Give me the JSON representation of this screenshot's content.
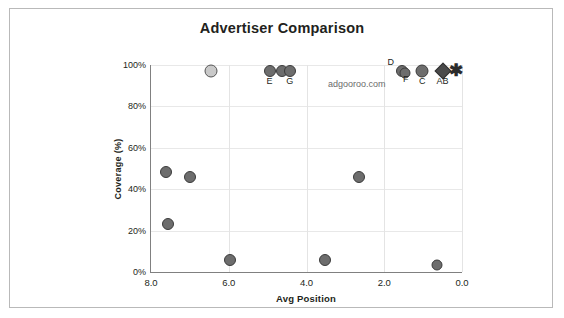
{
  "chart_data": {
    "type": "scatter",
    "title": "Advertiser Comparison",
    "xlabel": "Avg Position",
    "ylabel": "Coverage (%)",
    "xlim": [
      8.0,
      0.0
    ],
    "ylim": [
      0,
      100
    ],
    "x_reversed": true,
    "grid": true,
    "legend": "none",
    "xticks": [
      "8.0",
      "6.0",
      "4.0",
      "2.0",
      "0.0"
    ],
    "xtick_values": [
      8.0,
      6.0,
      4.0,
      2.0,
      0.0
    ],
    "yticks": [
      "0%",
      "20%",
      "40%",
      "60%",
      "80%",
      "100%"
    ],
    "ytick_values": [
      0,
      20,
      40,
      60,
      80,
      100
    ],
    "watermark": "adgooroo.com",
    "points": [
      {
        "label": "",
        "x": 6.45,
        "y": 97,
        "marker": "circle",
        "size": 13,
        "shade": "light"
      },
      {
        "label": "E",
        "x": 4.95,
        "y": 97,
        "marker": "circle",
        "size": 12,
        "shade": "dark"
      },
      {
        "label": "",
        "x": 4.62,
        "y": 97,
        "marker": "circle",
        "size": 12,
        "shade": "dark"
      },
      {
        "label": "G",
        "x": 4.43,
        "y": 97,
        "marker": "circle",
        "size": 12,
        "shade": "dark"
      },
      {
        "label": "D",
        "x": 1.55,
        "y": 97,
        "marker": "circle",
        "size": 12,
        "shade": "dark"
      },
      {
        "label": "F",
        "x": 1.47,
        "y": 96,
        "marker": "circle",
        "size": 11,
        "shade": "dark"
      },
      {
        "label": "C",
        "x": 1.02,
        "y": 97,
        "marker": "circle",
        "size": 13,
        "shade": "dark"
      },
      {
        "label": "AB",
        "x": 0.5,
        "y": 97,
        "marker": "diamond",
        "size": 12,
        "shade": "dark"
      },
      {
        "label": "",
        "x": 0.15,
        "y": 97,
        "marker": "star",
        "size": 14,
        "shade": "dark"
      },
      {
        "label": "",
        "x": 7.62,
        "y": 48.5,
        "marker": "circle",
        "size": 12,
        "shade": "dark"
      },
      {
        "label": "",
        "x": 7.0,
        "y": 45.8,
        "marker": "circle",
        "size": 12,
        "shade": "dark"
      },
      {
        "label": "",
        "x": 7.55,
        "y": 23.0,
        "marker": "circle",
        "size": 12,
        "shade": "dark"
      },
      {
        "label": "",
        "x": 2.65,
        "y": 45.8,
        "marker": "circle",
        "size": 12,
        "shade": "dark"
      },
      {
        "label": "",
        "x": 5.96,
        "y": 6.0,
        "marker": "circle",
        "size": 12,
        "shade": "dark"
      },
      {
        "label": "",
        "x": 3.52,
        "y": 6.0,
        "marker": "circle",
        "size": 12,
        "shade": "dark"
      },
      {
        "label": "",
        "x": 0.65,
        "y": 3.2,
        "marker": "circle",
        "size": 11,
        "shade": "dark"
      }
    ]
  }
}
